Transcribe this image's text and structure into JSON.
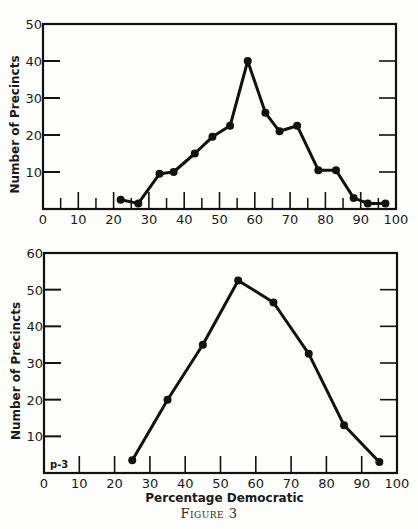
{
  "figure": {
    "caption": "Figure 3",
    "ink_color": "#111111",
    "background": "#fdfdfc"
  },
  "chart_data": [
    {
      "type": "line",
      "title": "",
      "xlabel": "",
      "ylabel": "Number of Precincts",
      "xlim": [
        0,
        100
      ],
      "ylim": [
        0,
        50
      ],
      "x_ticks": [
        0,
        10,
        20,
        30,
        40,
        50,
        60,
        70,
        80,
        90,
        100
      ],
      "x_minor_ticks": [
        5,
        15,
        25,
        35,
        45,
        55,
        65,
        75,
        85,
        95
      ],
      "y_ticks": [
        10,
        20,
        30,
        40,
        50
      ],
      "grid": false,
      "annotation": "",
      "x": [
        22,
        27,
        33,
        37,
        43,
        48,
        53,
        58,
        63,
        67,
        72,
        78,
        83,
        88,
        92,
        97
      ],
      "y": [
        2.5,
        1.5,
        9.5,
        10,
        15,
        19.5,
        22.5,
        40,
        26,
        21,
        22.5,
        10.5,
        10.5,
        3,
        1.5,
        1.5
      ],
      "frame": {
        "left": 43,
        "right": 396,
        "top": 24,
        "bottom": 209
      }
    },
    {
      "type": "line",
      "title": "",
      "xlabel": "Percentage Democratic",
      "ylabel": "Number of Precincts",
      "xlim": [
        0,
        100
      ],
      "ylim": [
        0,
        60
      ],
      "x_ticks": [
        0,
        10,
        20,
        30,
        40,
        50,
        60,
        70,
        80,
        90,
        100
      ],
      "x_minor_ticks": [],
      "y_ticks": [
        10,
        20,
        30,
        40,
        50,
        60
      ],
      "grid": false,
      "annotation": "p-3",
      "x": [
        25,
        35,
        45,
        55,
        65,
        75,
        85,
        95
      ],
      "y": [
        3.5,
        20,
        35,
        52.5,
        46.5,
        32.5,
        13,
        3
      ],
      "frame": {
        "left": 44,
        "right": 397,
        "top": 253,
        "bottom": 473
      }
    }
  ]
}
